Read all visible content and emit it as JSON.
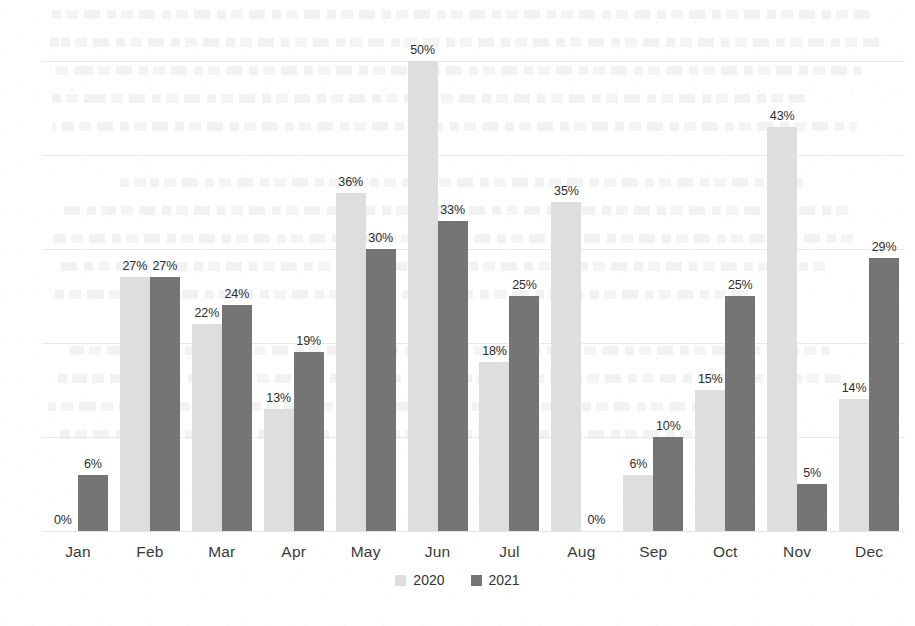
{
  "chart_data": {
    "type": "bar",
    "title": "",
    "subtitle": "",
    "xlabel": "",
    "ylabel": "",
    "categories": [
      "Jan",
      "Feb",
      "Mar",
      "Apr",
      "May",
      "Jun",
      "Jul",
      "Aug",
      "Sep",
      "Oct",
      "Nov",
      "Dec"
    ],
    "series": [
      {
        "name": "2020",
        "color": "#dedede",
        "values": [
          0,
          27,
          22,
          13,
          36,
          50,
          18,
          35,
          6,
          15,
          43,
          14
        ],
        "labels": [
          "0%",
          "27%",
          "22%",
          "13%",
          "36%",
          "50%",
          "18%",
          "35%",
          "6%",
          "15%",
          "43%",
          "14%"
        ]
      },
      {
        "name": "2021",
        "color": "#757575",
        "values": [
          6,
          27,
          24,
          19,
          30,
          33,
          25,
          0,
          10,
          25,
          5,
          29
        ],
        "labels": [
          "6%",
          "27%",
          "24%",
          "19%",
          "30%",
          "33%",
          "25%",
          "0%",
          "10%",
          "25%",
          "5%",
          "29%"
        ]
      }
    ],
    "ylim": [
      0,
      50
    ],
    "yticks": [
      0,
      10,
      20,
      30,
      40,
      50
    ],
    "ytick_labels": [
      "0%",
      "10%",
      "20%",
      "30%",
      "40%",
      "50%"
    ],
    "grid": true,
    "legend_position": "bottom",
    "value_labels": true,
    "value_label_suffix": "%"
  },
  "legend": {
    "items": [
      {
        "label": "2020",
        "swatch_name": "legend-swatch-2020"
      },
      {
        "label": "2021",
        "swatch_name": "legend-swatch-2021"
      }
    ]
  }
}
